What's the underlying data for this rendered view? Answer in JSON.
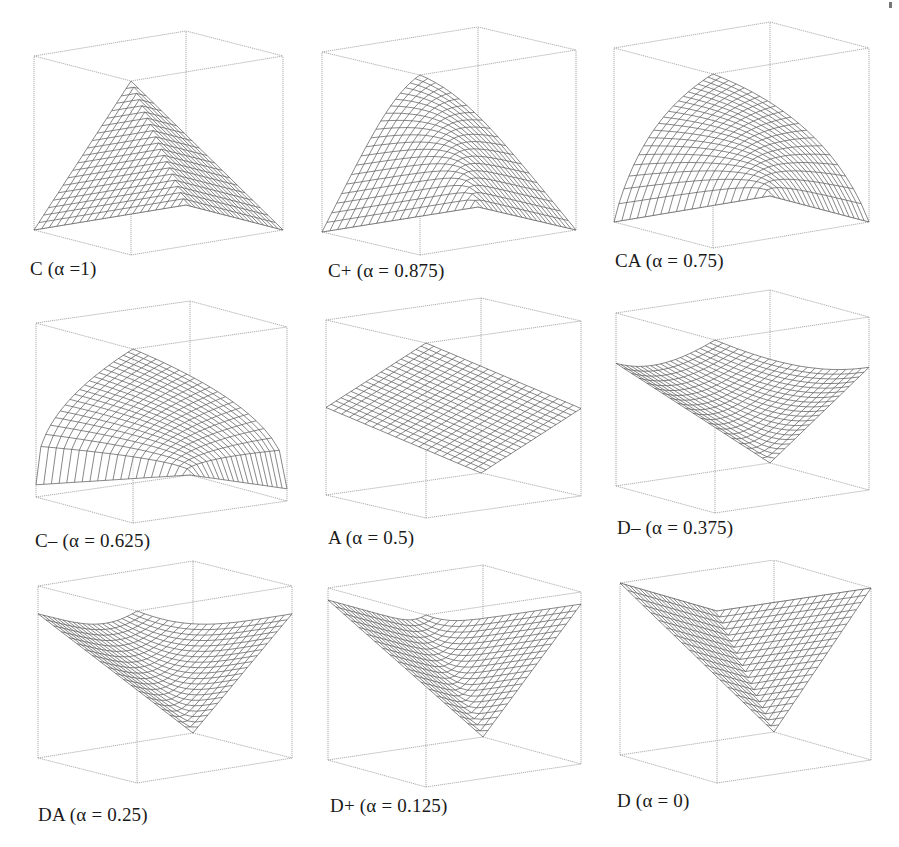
{
  "figure": {
    "stray_mark": "'"
  },
  "chart_data": {
    "type": "surface-grid",
    "title": "",
    "layout": {
      "rows": 3,
      "cols": 3
    },
    "axes": {
      "x_range": [
        0,
        1
      ],
      "y_range": [
        0,
        1
      ],
      "z_range": [
        0,
        1
      ],
      "grid": "wireframe",
      "box": true,
      "ticks": false
    },
    "function_family": "generalized conjunction/disjunction z = GCD(x, y; alpha), alpha = andness degree",
    "panels": [
      {
        "id": "C",
        "label": "C (α =1)",
        "alpha": 1.0,
        "shape": "pyramid (min)"
      },
      {
        "id": "C+",
        "label": "C+ (α = 0.875)",
        "alpha": 0.875,
        "shape": "strong partial conjunction"
      },
      {
        "id": "CA",
        "label": "CA (α = 0.75)",
        "alpha": 0.75,
        "shape": "medium partial conjunction"
      },
      {
        "id": "C-",
        "label": "C– (α = 0.625)",
        "alpha": 0.625,
        "shape": "weak partial conjunction"
      },
      {
        "id": "A",
        "label": "A (α = 0.5)",
        "alpha": 0.5,
        "shape": "plane (arithmetic mean)"
      },
      {
        "id": "D-",
        "label": "D– (α = 0.375)",
        "alpha": 0.375,
        "shape": "weak partial disjunction"
      },
      {
        "id": "DA",
        "label": "DA (α = 0.25)",
        "alpha": 0.25,
        "shape": "medium partial disjunction"
      },
      {
        "id": "D+",
        "label": "D+ (α = 0.125)",
        "alpha": 0.125,
        "shape": "strong partial disjunction"
      },
      {
        "id": "D",
        "label": "D (α = 0)",
        "alpha": 0.0,
        "shape": "inverted pyramid (max)"
      }
    ],
    "mesh_resolution": 20
  },
  "style": {
    "box_color": "#9a9a9a",
    "mesh_color": "#555555",
    "text_color": "#1a1a1a",
    "background": "#ffffff"
  }
}
